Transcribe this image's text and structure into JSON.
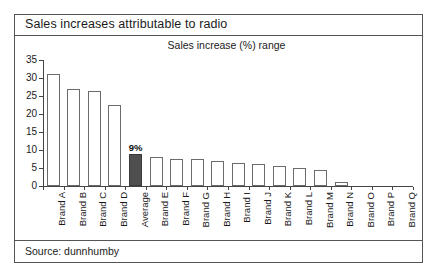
{
  "figure": {
    "title": "Sales increases attributable to radio",
    "source": "Source: dunnhumby",
    "border_color": "#555555"
  },
  "chart_data": {
    "type": "bar",
    "title": "Sales increase (%) range",
    "subtitle": "Sales increase (%) range",
    "xlabel": "",
    "ylabel": "",
    "ylim": [
      0,
      35
    ],
    "yticks": [
      0,
      5,
      10,
      15,
      20,
      25,
      30,
      35
    ],
    "grid": false,
    "legend": false,
    "bar_color": "#ffffff",
    "bar_edge_color": "#6b6b6b",
    "highlight_color": "#4f4f4f",
    "categories": [
      "Brand A",
      "Brand B",
      "Brand C",
      "Brand D",
      "Average",
      "Brand E",
      "Brand F",
      "Brand G",
      "Brand H",
      "Brand I",
      "Brand J",
      "Brand K",
      "Brand L",
      "Brand M",
      "Brand N",
      "Brand O",
      "Brand P",
      "Brand Q"
    ],
    "values": [
      31,
      27,
      26.5,
      22.5,
      9,
      8,
      7.5,
      7.5,
      7,
      6.5,
      6,
      5.5,
      5,
      4.5,
      1,
      0,
      0,
      0
    ],
    "highlight_index": 4,
    "data_labels": {
      "4": "9%"
    }
  }
}
